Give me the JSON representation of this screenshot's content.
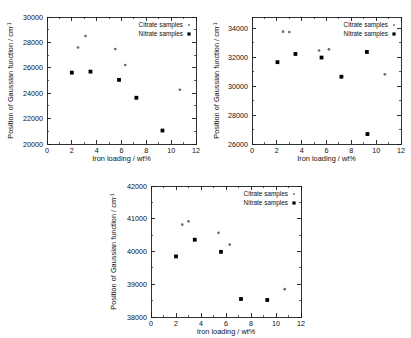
{
  "figure": {
    "panel_count": 3,
    "background": "#ffffff",
    "series_colors": {
      "citrate": "#6b6b6b",
      "nitrate": "#000000"
    }
  },
  "common": {
    "xlabel": "Iron loading / wt%",
    "ylabel_main": "Position of Gaussian function / cm",
    "ylabel_exponent": "-1",
    "legend": {
      "citrate_label": "Citrate samples",
      "nitrate_label": "Nitrate samples"
    }
  },
  "chart_data": [
    {
      "id": "panel-a",
      "type": "scatter",
      "title": "",
      "xlabel": "Iron loading / wt%",
      "ylabel": "Position of Gaussian function / cm-1",
      "xlim": [
        0,
        12
      ],
      "ylim": [
        20000,
        30000
      ],
      "xticks": [
        0,
        2,
        4,
        6,
        8,
        10,
        12
      ],
      "xtick_labels": [
        "0",
        "2",
        "4",
        "6",
        "8",
        "10",
        "12"
      ],
      "yticks": [
        20000,
        22000,
        24000,
        26000,
        28000,
        30000
      ],
      "ytick_labels": [
        "20000",
        "22000",
        "24000",
        "26000",
        "28000",
        "30000"
      ],
      "x_minor_step": 1,
      "y_minor_step": 1000,
      "grid": false,
      "legend_position": "top-right",
      "series": [
        {
          "name": "Citrate samples",
          "marker": "small-dot",
          "color": "#6b6b6b",
          "points": [
            {
              "x": 2.5,
              "y": 27600
            },
            {
              "x": 3.1,
              "y": 28500
            },
            {
              "x": 5.5,
              "y": 27480
            },
            {
              "x": 6.3,
              "y": 26220
            },
            {
              "x": 10.7,
              "y": 24270
            }
          ]
        },
        {
          "name": "Nitrate samples",
          "marker": "filled-square",
          "color": "#000000",
          "points": [
            {
              "x": 2.0,
              "y": 25620
            },
            {
              "x": 3.5,
              "y": 25700
            },
            {
              "x": 5.8,
              "y": 25050
            },
            {
              "x": 7.2,
              "y": 23640
            },
            {
              "x": 9.3,
              "y": 21060
            }
          ]
        }
      ]
    },
    {
      "id": "panel-b",
      "type": "scatter",
      "title": "",
      "xlabel": "Iron loading / wt%",
      "ylabel": "Position of Gaussian function / cm-1",
      "xlim": [
        0,
        12
      ],
      "ylim": [
        26000,
        34800
      ],
      "xticks": [
        0,
        2,
        4,
        6,
        8,
        10,
        12
      ],
      "xtick_labels": [
        "0",
        "2",
        "4",
        "6",
        "8",
        "10",
        "12"
      ],
      "yticks": [
        26000,
        28000,
        30000,
        32000,
        34000
      ],
      "ytick_labels": [
        "26000",
        "28000",
        "30000",
        "32000",
        "34000"
      ],
      "x_minor_step": 1,
      "y_minor_step": 1000,
      "grid": false,
      "legend_position": "top-right",
      "series": [
        {
          "name": "Citrate samples",
          "marker": "small-dot",
          "color": "#6b6b6b",
          "points": [
            {
              "x": 2.5,
              "y": 33780
            },
            {
              "x": 3.0,
              "y": 33760
            },
            {
              "x": 5.4,
              "y": 32480
            },
            {
              "x": 6.2,
              "y": 32560
            },
            {
              "x": 10.7,
              "y": 30830
            }
          ]
        },
        {
          "name": "Nitrate samples",
          "marker": "filled-square",
          "color": "#000000",
          "points": [
            {
              "x": 2.05,
              "y": 31670
            },
            {
              "x": 3.5,
              "y": 32240
            },
            {
              "x": 5.6,
              "y": 31990
            },
            {
              "x": 7.2,
              "y": 30660
            },
            {
              "x": 9.25,
              "y": 32380
            },
            {
              "x": 9.3,
              "y": 26690
            }
          ]
        }
      ]
    },
    {
      "id": "panel-c",
      "type": "scatter",
      "title": "",
      "xlabel": "Iron loading / wt%",
      "ylabel": "Position of Gaussian function / cm-1",
      "xlim": [
        0,
        12
      ],
      "ylim": [
        38000,
        42000
      ],
      "xticks": [
        0,
        2,
        4,
        6,
        8,
        10,
        12
      ],
      "xtick_labels": [
        "0",
        "2",
        "4",
        "6",
        "8",
        "10",
        "12"
      ],
      "yticks": [
        38000,
        39000,
        40000,
        41000,
        42000
      ],
      "ytick_labels": [
        "38000",
        "39000",
        "40000",
        "41000",
        "42000"
      ],
      "x_minor_step": 1,
      "y_minor_step": 500,
      "grid": false,
      "legend_position": "top-right",
      "series": [
        {
          "name": "Citrate samples",
          "marker": "small-dot",
          "color": "#6b6b6b",
          "points": [
            {
              "x": 2.5,
              "y": 40820
            },
            {
              "x": 3.0,
              "y": 40920
            },
            {
              "x": 5.4,
              "y": 40570
            },
            {
              "x": 6.3,
              "y": 40210
            },
            {
              "x": 10.7,
              "y": 38850
            }
          ]
        },
        {
          "name": "Nitrate samples",
          "marker": "filled-square",
          "color": "#000000",
          "points": [
            {
              "x": 2.0,
              "y": 39850
            },
            {
              "x": 3.5,
              "y": 40360
            },
            {
              "x": 5.6,
              "y": 39990
            },
            {
              "x": 7.2,
              "y": 38550
            },
            {
              "x": 9.3,
              "y": 38520
            }
          ]
        }
      ]
    }
  ]
}
